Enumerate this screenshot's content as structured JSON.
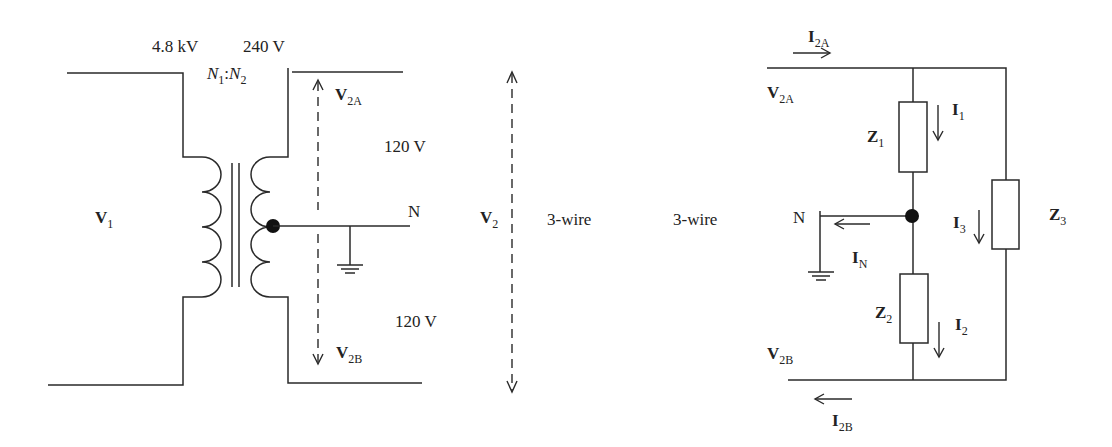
{
  "left_circuit": {
    "primary_voltage": "4.8 kV",
    "secondary_voltage": "240 V",
    "turns_ratio": {
      "n1": "N",
      "n1_sub": "1",
      "separator": ":",
      "n2": "N",
      "n2_sub": "2"
    },
    "v1": {
      "main": "V",
      "sub": "1"
    },
    "v2a": {
      "main": "V",
      "sub": "2A"
    },
    "v2b": {
      "main": "V",
      "sub": "2B"
    },
    "upper_half_voltage": "120 V",
    "lower_half_voltage": "120 V",
    "neutral_label": "N",
    "v2": {
      "main": "V",
      "sub": "2"
    },
    "wire_label": "3-wire"
  },
  "right_circuit": {
    "wire_label": "3-wire",
    "i2a": {
      "main": "I",
      "sub": "2A"
    },
    "i2b": {
      "main": "I",
      "sub": "2B"
    },
    "v2a": {
      "main": "V",
      "sub": "2A"
    },
    "v2b": {
      "main": "V",
      "sub": "2B"
    },
    "z1": {
      "main": "Z",
      "sub": "1"
    },
    "z2": {
      "main": "Z",
      "sub": "2"
    },
    "z3": {
      "main": "Z",
      "sub": "3"
    },
    "i1": {
      "main": "I",
      "sub": "1"
    },
    "i2": {
      "main": "I",
      "sub": "2"
    },
    "i3": {
      "main": "I",
      "sub": "3"
    },
    "in": {
      "main": "I",
      "sub": "N"
    },
    "neutral_label": "N"
  },
  "colors": {
    "line": "#2a2a2a",
    "background": "#ffffff",
    "node": "#111111"
  }
}
